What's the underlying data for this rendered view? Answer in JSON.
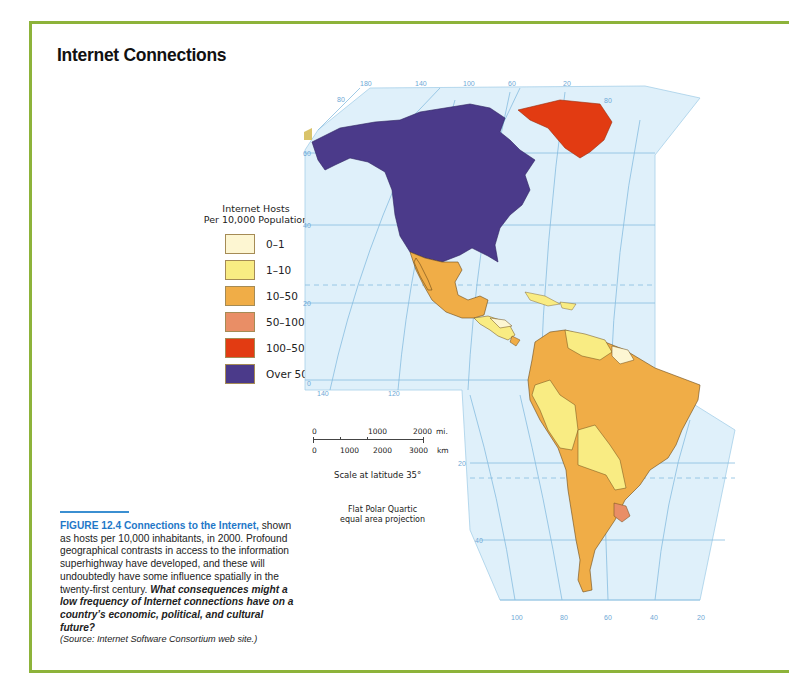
{
  "title": "Internet Connections",
  "legend": {
    "title_line1": "Internet Hosts",
    "title_line2": "Per 10,000 Population",
    "items": [
      {
        "label": "0–1",
        "color": "#fdf6d2"
      },
      {
        "label": "1–10",
        "color": "#f9ec83"
      },
      {
        "label": "10–50",
        "color": "#f0ad47"
      },
      {
        "label": "50–100",
        "color": "#e98e66"
      },
      {
        "label": "100–500",
        "color": "#e23b12"
      },
      {
        "label": "Over 500",
        "color": "#4b3a8a"
      }
    ]
  },
  "map": {
    "ocean_color": "#dff0fa",
    "grid_color": "#86bde0",
    "longitude_labels_top": [
      "180",
      "140",
      "100",
      "60",
      "20"
    ],
    "longitude_labels_bottom_north": [
      "140",
      "120"
    ],
    "longitude_labels_bottom_south": [
      "100",
      "80",
      "60",
      "40",
      "20"
    ],
    "latitude_labels_left": [
      "80",
      "60",
      "40",
      "20",
      "0"
    ],
    "latitude_labels_right_top": [
      "80"
    ],
    "latitude_labels_south": [
      "20",
      "40"
    ]
  },
  "scale_bar": {
    "mi_labels": [
      "0",
      "1000",
      "2000"
    ],
    "mi_unit": "mi.",
    "km_labels": [
      "0",
      "1000",
      "2000",
      "3000"
    ],
    "km_unit": "km",
    "caption": "Scale at latitude 35°"
  },
  "projection": {
    "line1": "Flat Polar Quartic",
    "line2": "equal area projection"
  },
  "caption": {
    "figure_label": "FIGURE 12.4",
    "heading": "Connections to the Internet,",
    "body": " shown as hosts per 10,000 inhabitants, in 2000. Profound geographical contrasts in access to the information superhighway have developed, and these will undoubtedly have some influence spatially in the twenty-first century. ",
    "question": "What consequences might a low frequency of Internet connections have on a country’s economic, political, and cultural future?",
    "source": "(Source: Internet Software Consortium web site.)"
  }
}
